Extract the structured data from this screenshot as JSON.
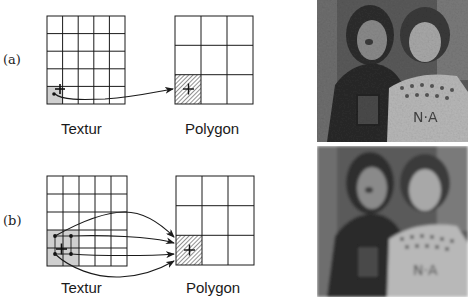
{
  "figure": {
    "rows": [
      {
        "id": "a",
        "label": "(a)",
        "texture_caption": "Textur",
        "polygon_caption": "Polygon",
        "description": "nearest neighbor: one texel mapped to one pixel"
      },
      {
        "id": "b",
        "label": "(b)",
        "texture_caption": "Textur",
        "polygon_caption": "Polygon",
        "description": "bilinear filtering: four texels mapped to one pixel"
      }
    ],
    "texture_grid": {
      "cols": 5,
      "rows": 5
    },
    "polygon_grid": {
      "cols": 3,
      "rows": 3
    },
    "colors": {
      "line": "#1a1a1a",
      "texel_highlight": "#cfcfcf",
      "hatch": "#555555",
      "background": "#ffffff"
    },
    "photos": [
      {
        "row": "a",
        "description": "two children, sharp/pixelated rendering"
      },
      {
        "row": "b",
        "description": "two children, smoothed/blurred rendering"
      }
    ]
  }
}
